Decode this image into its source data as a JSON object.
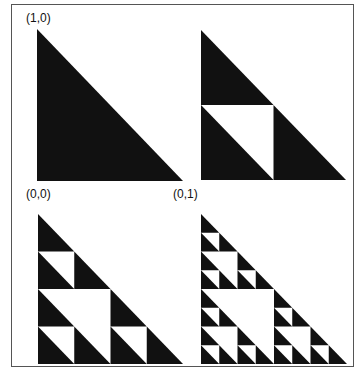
{
  "diagram": {
    "labels": [
      {
        "id": "top-vertex",
        "text": "(1,0)",
        "x": 26,
        "y": 12
      },
      {
        "id": "origin",
        "text": "(0,0)",
        "x": 26,
        "y": 188
      },
      {
        "id": "right-vertex",
        "text": "(0,1)",
        "x": 173,
        "y": 188
      }
    ],
    "panels": [
      {
        "depth": 0,
        "x": 37,
        "y": 29,
        "w": 146,
        "h": 152
      },
      {
        "depth": 1,
        "x": 201,
        "y": 30,
        "w": 145,
        "h": 150
      },
      {
        "depth": 2,
        "x": 38,
        "y": 214,
        "w": 145,
        "h": 150
      },
      {
        "depth": 3,
        "x": 201,
        "y": 214,
        "w": 146,
        "h": 150
      }
    ],
    "colors": {
      "fill": "#111111",
      "hole": "#ffffff",
      "border": "#555555"
    }
  }
}
